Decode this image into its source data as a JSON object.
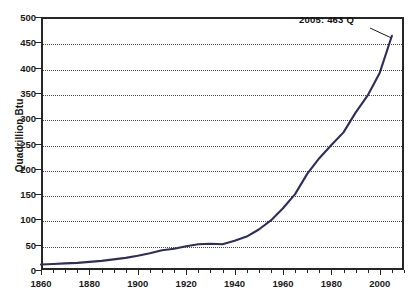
{
  "chart_data": {
    "type": "line",
    "title": "",
    "xlabel": "",
    "ylabel": "Quadrillion Btu",
    "xlim": [
      1860,
      2010
    ],
    "ylim": [
      0,
      500
    ],
    "grid": true,
    "legend": false,
    "series_name": "World Energy Consumption",
    "line_color": "#2e2e5c",
    "annotations": [
      {
        "text": "2005: 463 Q",
        "x": 2005,
        "y": 463
      }
    ],
    "y_ticks": [
      0,
      50,
      100,
      150,
      200,
      250,
      300,
      350,
      400,
      450,
      500
    ],
    "x_ticks": [
      1860,
      1880,
      1900,
      1920,
      1940,
      1960,
      1980,
      2000
    ],
    "x_minor_step": 5,
    "x": [
      1860,
      1865,
      1870,
      1875,
      1880,
      1885,
      1890,
      1895,
      1900,
      1905,
      1910,
      1915,
      1920,
      1925,
      1930,
      1935,
      1940,
      1945,
      1950,
      1955,
      1960,
      1965,
      1970,
      1975,
      1980,
      1985,
      1990,
      1995,
      2000,
      2005
    ],
    "y": [
      11,
      12,
      13,
      14,
      16,
      18,
      21,
      24,
      28,
      33,
      39,
      42,
      47,
      51,
      52,
      51,
      58,
      66,
      80,
      98,
      122,
      150,
      190,
      221,
      247,
      272,
      311,
      345,
      390,
      463
    ]
  },
  "axis": {
    "y_title": "Quadrillion Btu"
  }
}
